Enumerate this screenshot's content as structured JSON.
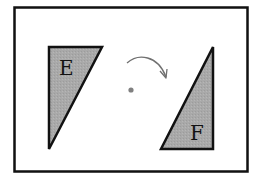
{
  "diagram": {
    "shapes": [
      {
        "label": "E",
        "fill": "#a8a8a8"
      },
      {
        "label": "F",
        "fill": "#a8a8a8"
      }
    ],
    "center_point_color": "#808080",
    "arrow_color": "#707070",
    "frame_color": "#111111"
  }
}
